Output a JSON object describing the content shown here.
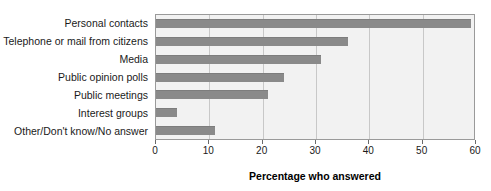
{
  "chart_data": {
    "type": "bar",
    "orientation": "horizontal",
    "title": "",
    "xlabel": "Percentage who answered",
    "ylabel": "",
    "categories": [
      "Personal contacts",
      "Telephone or mail from citizens",
      "Media",
      "Public opinion polls",
      "Public meetings",
      "Interest groups",
      "Other/Don't know/No answer"
    ],
    "values": [
      59,
      36,
      31,
      24,
      21,
      4,
      11
    ],
    "xlim": [
      0,
      60
    ],
    "xticks": [
      0,
      10,
      20,
      30,
      40,
      50,
      60
    ],
    "xtick_labels": [
      "0",
      "10",
      "20",
      "30",
      "40",
      "50",
      "60"
    ],
    "grid": true,
    "grid_axis": "x",
    "legend": false,
    "colors": {
      "bar_fill": "#8a8a8a",
      "plot_background": "#f2f2f2",
      "plot_border": "#9a9a9a",
      "gridline": "#c8c8c8",
      "text": "#1a1a1a"
    }
  }
}
